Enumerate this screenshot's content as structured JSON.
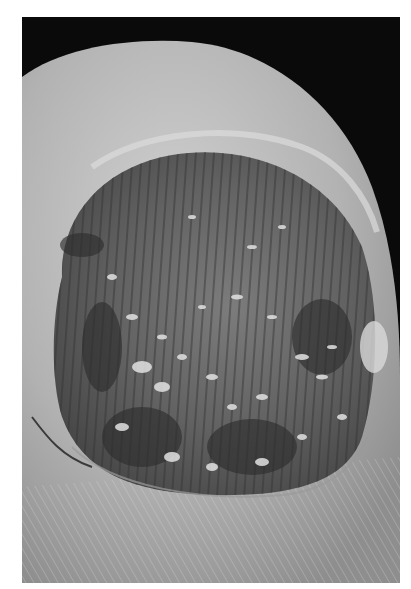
{
  "image": {
    "subject": "close-up photograph of a fingertip with a dystrophic, pitted nail plate",
    "mode": "grayscale",
    "colors": {
      "background": "#0a0a0a",
      "skin": "#b4b4b4",
      "skin_highlight": "#d2d2d2",
      "nail_bed": "#6e6e6e",
      "nail_dark": "#3c3c3c",
      "debris": "#dcdcdc",
      "margin": "#ffffff"
    }
  }
}
